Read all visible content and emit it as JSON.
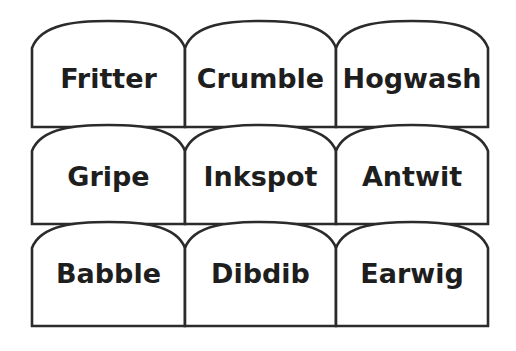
{
  "figure": {
    "type": "arch-card-grid",
    "rows": 3,
    "columns": 3,
    "background_color": "#ffffff",
    "stroke_color": "#2b2b2b",
    "text_color": "#1e1e1e",
    "fill_color": "#ffffff"
  },
  "cards": [
    {
      "id": "card-1",
      "row": 1,
      "column": 1,
      "label": "Fritter"
    },
    {
      "id": "card-2",
      "row": 1,
      "column": 2,
      "label": "Crumble"
    },
    {
      "id": "card-3",
      "row": 1,
      "column": 3,
      "label": "Hogwash"
    },
    {
      "id": "card-4",
      "row": 2,
      "column": 1,
      "label": "Gripe"
    },
    {
      "id": "card-5",
      "row": 2,
      "column": 2,
      "label": "Inkspot"
    },
    {
      "id": "card-6",
      "row": 2,
      "column": 3,
      "label": "Antwit"
    },
    {
      "id": "card-7",
      "row": 3,
      "column": 1,
      "label": "Babble"
    },
    {
      "id": "card-8",
      "row": 3,
      "column": 2,
      "label": "Dibdib"
    },
    {
      "id": "card-9",
      "row": 3,
      "column": 3,
      "label": "Earwig"
    }
  ],
  "geometry": {
    "columns_x": [
      32,
      185,
      336,
      488
    ],
    "rows": [
      {
        "arch_top_y": 21,
        "shoulder_y": 48,
        "bottom_y": 127
      },
      {
        "arch_top_y": 125,
        "shoulder_y": 151,
        "bottom_y": 224
      },
      {
        "arch_top_y": 222,
        "shoulder_y": 248,
        "bottom_y": 326
      }
    ],
    "label_baseline_y": [
      80,
      178,
      275
    ]
  }
}
